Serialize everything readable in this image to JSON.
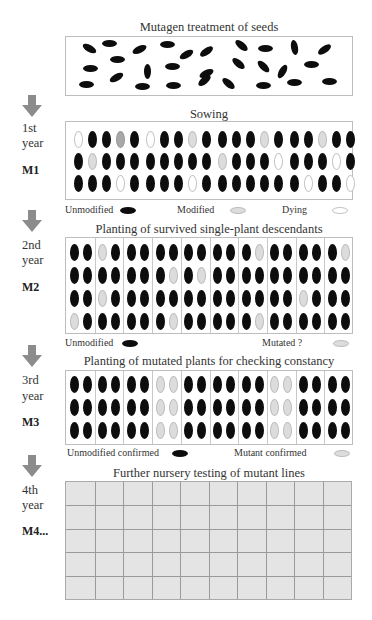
{
  "diagram": {
    "sections": [
      {
        "id": "mutagen",
        "title": "Mutagen treatment of seeds"
      },
      {
        "id": "m1",
        "title": "Sowing",
        "year_label": "1st",
        "year_word": "year",
        "generation": "M1",
        "legend": [
          {
            "label": "Unmodified",
            "color": "#0d0d0d"
          },
          {
            "label": "Modified",
            "color": "#dcdcdc"
          },
          {
            "label": "Dying",
            "color": "#ffffff"
          }
        ]
      },
      {
        "id": "m2",
        "title": "Planting of survived single-plant descendants",
        "year_label": "2nd",
        "year_word": "year",
        "generation": "M2",
        "legend": [
          {
            "label": "Unmodified",
            "color": "#0d0d0d"
          },
          {
            "label": "Mutated ?",
            "color": "#dcdcdc"
          }
        ]
      },
      {
        "id": "m3",
        "title": "Planting of mutated plants for checking constancy",
        "year_label": "3rd",
        "year_word": "year",
        "generation": "M3",
        "legend": [
          {
            "label": "Unmodified confirmed",
            "color": "#0d0d0d"
          },
          {
            "label": "Mutant confirmed",
            "color": "#dcdcdc"
          }
        ]
      },
      {
        "id": "m4",
        "title": "Further nursery testing of mutant lines",
        "year_label": "4th",
        "year_word": "year",
        "generation": "M4..."
      }
    ],
    "arrow_color": "#8c8c8c",
    "seed_key": {
      "B": "unmodified (black)",
      "G": "modified (mid gray)",
      "L": "modified / mutated (light gray)",
      "W": "dying (white outline)"
    },
    "mutagen_seeds": [
      [
        88,
        47,
        30
      ],
      [
        108,
        42,
        0
      ],
      [
        138,
        48,
        -25
      ],
      [
        166,
        43,
        0
      ],
      [
        185,
        53,
        -30
      ],
      [
        205,
        50,
        -35
      ],
      [
        240,
        44,
        40
      ],
      [
        264,
        47,
        0
      ],
      [
        293,
        46,
        80
      ],
      [
        323,
        48,
        -35
      ],
      [
        116,
        58,
        0
      ],
      [
        89,
        67,
        0
      ],
      [
        146,
        70,
        90
      ],
      [
        171,
        65,
        0
      ],
      [
        205,
        72,
        -25
      ],
      [
        237,
        62,
        40
      ],
      [
        262,
        65,
        45
      ],
      [
        281,
        70,
        -60
      ],
      [
        310,
        63,
        0
      ],
      [
        85,
        83,
        0
      ],
      [
        115,
        76,
        -30
      ],
      [
        141,
        85,
        0
      ],
      [
        172,
        84,
        0
      ],
      [
        203,
        79,
        -40
      ],
      [
        227,
        82,
        40
      ],
      [
        262,
        84,
        0
      ],
      [
        293,
        81,
        0
      ],
      [
        328,
        80,
        0
      ]
    ],
    "m1_groups": [
      [
        "WBBGB",
        "BLBBB",
        "BBBWB"
      ],
      [
        "WBBLB",
        "BBBBB",
        "BBBWB"
      ],
      [
        "BBBLB",
        "LBBBW",
        "BBBBB"
      ],
      [
        "BBLBB",
        "BBBWB",
        "BWBBW"
      ]
    ],
    "m2_columns": [
      [
        "BB",
        "BB",
        "BB",
        "LB"
      ],
      [
        "LB",
        "BB",
        "LB",
        "BB"
      ],
      [
        "BB",
        "BB",
        "BB",
        "BB"
      ],
      [
        "BB",
        "BL",
        "BB",
        "BL"
      ],
      [
        "BB",
        "BL",
        "BB",
        "BB"
      ],
      [
        "BB",
        "BB",
        "BB",
        "BB"
      ],
      [
        "BL",
        "BB",
        "BB",
        "BL"
      ],
      [
        "BB",
        "BB",
        "BB",
        "BB"
      ],
      [
        "BB",
        "BB",
        "LB",
        "BB"
      ],
      [
        "BL",
        "BB",
        "BB",
        "BB"
      ]
    ],
    "m3_columns": [
      "B",
      "B",
      "B",
      "L",
      "B",
      "B",
      "B",
      "L",
      "B",
      "B"
    ],
    "m4_grid": {
      "columns": 10,
      "rows": 5,
      "fill": "#e4e4e4"
    }
  }
}
